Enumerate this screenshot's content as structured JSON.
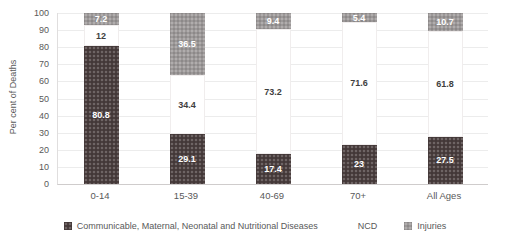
{
  "chart_data": {
    "type": "bar",
    "stacked": true,
    "orientation": "vertical",
    "title": "",
    "xlabel": "",
    "ylabel": "Per cent of Deaths",
    "ylim": [
      0,
      100
    ],
    "ytick_step": 10,
    "ytick_labels": [
      "0",
      "10",
      "20",
      "30",
      "40",
      "50",
      "60",
      "70",
      "80",
      "90",
      "100"
    ],
    "grid": true,
    "legend_position": "bottom",
    "categories": [
      "0-14",
      "15-39",
      "40-69",
      "70+",
      "All Ages"
    ],
    "series": [
      {
        "name": "Communicable, Maternal, Neonatal and Nutritional Diseases",
        "color": "#4a3e3e",
        "label_color": "#ffffff",
        "pattern": "dots",
        "values": [
          80.8,
          29.1,
          17.4,
          23,
          27.5
        ]
      },
      {
        "name": "NCD",
        "color": "#ffffff",
        "label_color": "#3f3f3f",
        "pattern": "none",
        "values": [
          12,
          34.4,
          73.2,
          71.6,
          61.8
        ]
      },
      {
        "name": "Injuries",
        "color": "#9c9898",
        "label_color": "#ffffff",
        "pattern": "dots",
        "values": [
          7.2,
          36.5,
          9.4,
          5.4,
          10.7
        ]
      }
    ]
  }
}
